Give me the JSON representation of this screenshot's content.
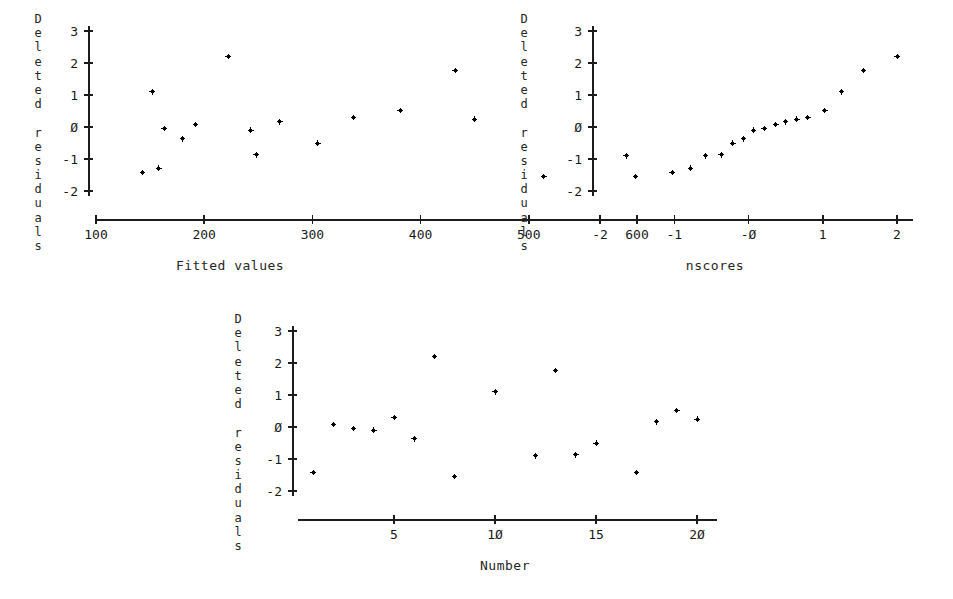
{
  "figure": {
    "background_color": "#ffffff",
    "ink_color": "#000000",
    "marker_glyph": "plus-dot"
  },
  "chart_data": [
    {
      "id": "residuals-vs-fitted",
      "type": "scatter",
      "title": "",
      "xlabel": "Fitted values",
      "ylabel": "Deleted residuals",
      "ylabel_stacked": [
        "D",
        "e",
        "l",
        "e",
        "t",
        "e",
        "d",
        "",
        "r",
        "e",
        "s",
        "i",
        "d",
        "u",
        "a",
        "l",
        "s"
      ],
      "xticks": [
        100,
        200,
        300,
        400,
        500,
        600
      ],
      "xtick_labels": [
        "100",
        "200",
        "300",
        "400",
        "500",
        "600"
      ],
      "yticks": [
        3,
        2,
        1,
        0,
        -1,
        -2
      ],
      "ytick_labels": [
        "3",
        "2",
        "1",
        "Ø",
        "-1",
        "-2"
      ],
      "xlim": [
        75,
        645
      ],
      "ylim": [
        -2.45,
        3.3
      ],
      "grid": false,
      "legend": false,
      "points": [
        {
          "x": 143,
          "y": -1.42
        },
        {
          "x": 152,
          "y": 1.1
        },
        {
          "x": 158,
          "y": -1.29
        },
        {
          "x": 163,
          "y": -0.05
        },
        {
          "x": 180,
          "y": -0.37
        },
        {
          "x": 192,
          "y": 0.08
        },
        {
          "x": 222,
          "y": 2.2
        },
        {
          "x": 243,
          "y": -0.1
        },
        {
          "x": 248,
          "y": -0.87
        },
        {
          "x": 270,
          "y": 0.16
        },
        {
          "x": 305,
          "y": -0.5
        },
        {
          "x": 338,
          "y": 0.3
        },
        {
          "x": 381,
          "y": 0.52
        },
        {
          "x": 432,
          "y": 1.77
        },
        {
          "x": 450,
          "y": 0.25
        },
        {
          "x": 514,
          "y": -1.55
        },
        {
          "x": 590,
          "y": -0.9
        }
      ]
    },
    {
      "id": "normal-probability-plot",
      "type": "scatter",
      "title": "",
      "xlabel": "nscores",
      "ylabel": "Deleted residuals",
      "ylabel_stacked": [
        "D",
        "e",
        "l",
        "e",
        "t",
        "e",
        "d",
        "",
        "r",
        "e",
        "s",
        "i",
        "d",
        "u",
        "a",
        "l",
        "s"
      ],
      "xticks": [
        -2,
        -1,
        0,
        1,
        2
      ],
      "xtick_labels": [
        "-2",
        "-1",
        "-Ø",
        "1",
        "2"
      ],
      "yticks": [
        3,
        2,
        1,
        0,
        -1,
        -2
      ],
      "ytick_labels": [
        "3",
        "2",
        "1",
        "Ø",
        "-1",
        "-2"
      ],
      "xlim": [
        -2.1,
        2.35
      ],
      "ylim": [
        -2.45,
        3.3
      ],
      "grid": false,
      "legend": false,
      "points": [
        {
          "x": -1.52,
          "y": -1.55
        },
        {
          "x": -1.03,
          "y": -1.42
        },
        {
          "x": -0.78,
          "y": -1.29
        },
        {
          "x": -0.58,
          "y": -0.9
        },
        {
          "x": -0.37,
          "y": -0.87
        },
        {
          "x": -0.21,
          "y": -0.5
        },
        {
          "x": -0.07,
          "y": -0.37
        },
        {
          "x": 0.07,
          "y": -0.1
        },
        {
          "x": 0.21,
          "y": -0.05
        },
        {
          "x": 0.37,
          "y": 0.08
        },
        {
          "x": 0.5,
          "y": 0.16
        },
        {
          "x": 0.65,
          "y": 0.25
        },
        {
          "x": 0.8,
          "y": 0.3
        },
        {
          "x": 1.03,
          "y": 0.52
        },
        {
          "x": 1.25,
          "y": 1.1
        },
        {
          "x": 1.55,
          "y": 1.77
        },
        {
          "x": 2.0,
          "y": 2.2
        }
      ]
    },
    {
      "id": "residuals-vs-order",
      "type": "scatter",
      "title": "",
      "xlabel": "Number",
      "ylabel": "Deleted residuals",
      "ylabel_stacked": [
        "D",
        "e",
        "l",
        "e",
        "t",
        "e",
        "d",
        "",
        "r",
        "e",
        "s",
        "i",
        "d",
        "u",
        "a",
        "l",
        "s"
      ],
      "xticks": [
        5,
        10,
        15,
        20
      ],
      "xtick_labels": [
        "5",
        "1Ø",
        "15",
        "2Ø"
      ],
      "yticks": [
        3,
        2,
        1,
        0,
        -1,
        -2
      ],
      "ytick_labels": [
        "3",
        "2",
        "1",
        "Ø",
        "-1",
        "-2"
      ],
      "xlim": [
        0.2,
        21.5
      ],
      "ylim": [
        -2.45,
        3.3
      ],
      "grid": false,
      "legend": false,
      "points": [
        {
          "x": 1,
          "y": -1.42
        },
        {
          "x": 2,
          "y": 0.08
        },
        {
          "x": 3,
          "y": -0.05
        },
        {
          "x": 4,
          "y": -0.1
        },
        {
          "x": 5,
          "y": 0.3
        },
        {
          "x": 6,
          "y": -0.37
        },
        {
          "x": 7,
          "y": 2.2
        },
        {
          "x": 8,
          "y": -1.55
        },
        {
          "x": 10,
          "y": 1.1
        },
        {
          "x": 12,
          "y": -0.9
        },
        {
          "x": 13,
          "y": 1.77
        },
        {
          "x": 14,
          "y": -0.87
        },
        {
          "x": 15,
          "y": -0.5
        },
        {
          "x": 17,
          "y": -1.42
        },
        {
          "x": 18,
          "y": 0.16
        },
        {
          "x": 19,
          "y": 0.52
        },
        {
          "x": 20,
          "y": 0.25
        }
      ]
    }
  ]
}
